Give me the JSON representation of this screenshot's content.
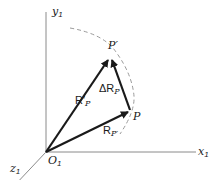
{
  "diagram": {
    "type": "vector-diagram",
    "axes": {
      "x": {
        "name": "x",
        "subscript": "1"
      },
      "y": {
        "name": "y",
        "subscript": "1"
      },
      "z": {
        "name": "z",
        "subscript": "1"
      }
    },
    "origin": {
      "name": "O",
      "subscript": "1"
    },
    "points": {
      "P": {
        "label": "P"
      },
      "P_prime": {
        "label": "P′"
      }
    },
    "vectors": {
      "R_P_prime_from_origin": {
        "base": "R",
        "prime": "′",
        "subscript": "P"
      },
      "R_P_to_P": {
        "base": "R",
        "subscript": "P′"
      },
      "delta": {
        "prefix": "Δ",
        "base": "R",
        "subscript": "P"
      }
    },
    "colors": {
      "ink": "#1a1a1a",
      "axis": "#8a8a8a",
      "arc": "#9a9a9a"
    }
  }
}
